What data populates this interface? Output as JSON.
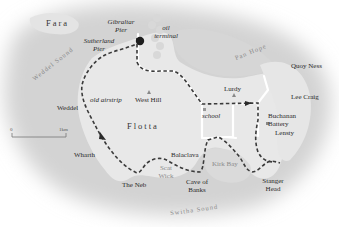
{
  "map": {
    "type": "walking route map",
    "islands": {
      "main": "Flotta",
      "north_west": "Fara"
    },
    "waters": {
      "weddel_sound": "Weddel Sound",
      "pan_hope": "Pan Hope",
      "switha_sound": "Switha Sound",
      "kirk_bay": "Kirk Bay",
      "scat_wick": "Scat Wick"
    },
    "places": {
      "gibraltar_pier": "Gibraltar Pier",
      "sutherland_pier": "Sutherland Pier",
      "oil_terminal": "oil terminal",
      "old_airstrip": "old airstrip",
      "west_hill": "West Hill",
      "weddel": "Weddel",
      "wharth": "Wharth",
      "the_neb": "The Neb",
      "balaclava": "Balaclava",
      "cave_of_banks": "Cave of Banks",
      "school": "school",
      "lurdy": "Lurdy",
      "quoy_ness": "Quoy Ness",
      "lee_craig": "Lee Craig",
      "buchanan_battery": "Buchanan Battery",
      "lensty": "Lensty",
      "stanger_head": "Stanger Head"
    },
    "scale": {
      "start": "0",
      "end": "1km"
    },
    "colors": {
      "sea": "#d4d4d4",
      "land": "#e9e9e9",
      "route_dash": "#3a3a3a",
      "road": "#ffffff",
      "start_marker": "#222222"
    }
  }
}
